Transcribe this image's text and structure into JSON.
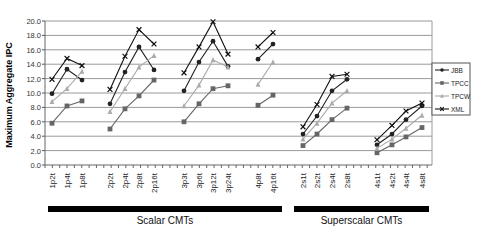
{
  "chart_data": {
    "type": "line",
    "title": "",
    "xlabel": "",
    "ylabel": "Maximum Aggregate IPC",
    "ylim": [
      0,
      20
    ],
    "yticks": [
      "0.0",
      "2.0",
      "4.0",
      "6.0",
      "8.0",
      "10.0",
      "12.0",
      "14.0",
      "16.0",
      "18.0",
      "20.0"
    ],
    "grid": true,
    "legend_position": "right",
    "categories": [
      "1p2t",
      "1p4t",
      "1p8t",
      "2p2t",
      "2p4t",
      "2p8t",
      "2p16t",
      "3p3t",
      "3p6t",
      "3p12t",
      "3p24t",
      "4p8t",
      "4p16t",
      "2s1t",
      "2s2t",
      "2s4t",
      "2s8t",
      "4s1t",
      "4s2t",
      "4s4t",
      "4s8t"
    ],
    "segments": [
      [
        0,
        2
      ],
      [
        3,
        6
      ],
      [
        7,
        10
      ],
      [
        11,
        12
      ],
      [
        13,
        16
      ],
      [
        17,
        20
      ]
    ],
    "category_groups": [
      {
        "label": "Scalar CMTs",
        "from": "1p2t",
        "to": "4p16t"
      },
      {
        "label": "Superscalar CMTs",
        "from": "2s1t",
        "to": "4s8t"
      }
    ],
    "series": [
      {
        "name": "JBB",
        "color": "#222222",
        "marker": "diamond",
        "values": [
          9.9,
          13.3,
          11.8,
          8.5,
          12.9,
          16.4,
          13.2,
          10.3,
          14.3,
          17.2,
          13.7,
          14.7,
          16.8,
          4.3,
          6.8,
          10.3,
          11.9,
          2.8,
          4.3,
          6.3,
          8.2
        ]
      },
      {
        "name": "TPCC",
        "color": "#666666",
        "marker": "square",
        "values": [
          5.8,
          8.2,
          8.9,
          5.0,
          7.8,
          9.6,
          11.8,
          6.0,
          8.5,
          10.6,
          11.0,
          8.3,
          9.7,
          2.7,
          4.3,
          6.3,
          7.9,
          1.7,
          2.8,
          3.9,
          5.2
        ]
      },
      {
        "name": "TPCW",
        "color": "#aaaaaa",
        "marker": "triangle",
        "values": [
          8.8,
          10.6,
          13.0,
          7.4,
          10.6,
          13.6,
          15.2,
          8.2,
          11.1,
          14.6,
          13.6,
          11.2,
          14.3,
          3.6,
          5.8,
          8.6,
          10.3,
          2.3,
          3.6,
          5.1,
          6.9
        ]
      },
      {
        "name": "XML",
        "color": "#111111",
        "marker": "x",
        "values": [
          11.9,
          14.8,
          13.8,
          10.5,
          15.1,
          18.8,
          16.8,
          12.8,
          16.4,
          19.9,
          15.4,
          16.4,
          18.4,
          5.3,
          8.4,
          12.3,
          12.6,
          3.5,
          5.5,
          7.5,
          8.6
        ]
      }
    ]
  },
  "layout_x": [
    52,
    67,
    82,
    110,
    125,
    139,
    154,
    184,
    199,
    213,
    228,
    258,
    273,
    303,
    317,
    332,
    347,
    377,
    392,
    406,
    422
  ]
}
